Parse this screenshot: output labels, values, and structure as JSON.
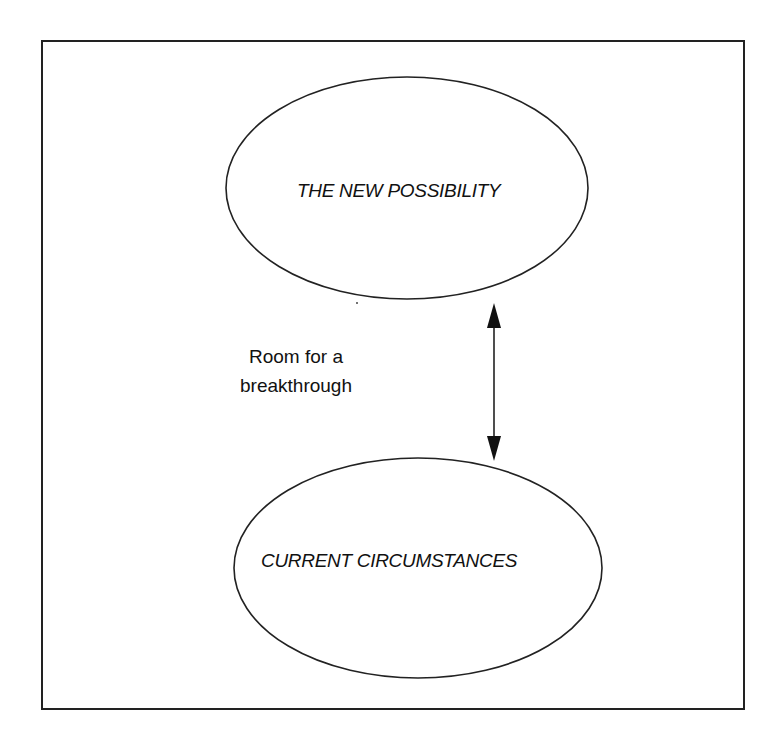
{
  "diagram": {
    "top_node": {
      "label": "THE NEW POSSIBILITY"
    },
    "bottom_node": {
      "label": "CURRENT CIRCUMSTANCES"
    },
    "gap_label": {
      "line1": "Room for a",
      "line2": "breakthrough"
    },
    "connector": {
      "type": "double-headed-arrow",
      "direction": "vertical"
    },
    "colors": {
      "stroke": "#222222",
      "background": "#ffffff",
      "text": "#111111"
    }
  }
}
